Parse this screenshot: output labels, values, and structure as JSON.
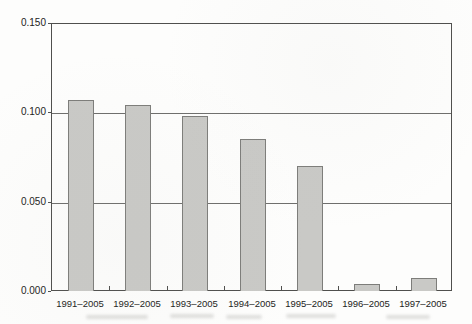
{
  "chart_data": {
    "type": "bar",
    "title": "",
    "categories": [
      "1991–2005",
      "1992–2005",
      "1993–2005",
      "1994–2005",
      "1995–2005",
      "1996–2005",
      "1997–2005"
    ],
    "values": [
      0.107,
      0.104,
      0.098,
      0.085,
      0.07,
      0.004,
      0.007
    ],
    "xlabel": "",
    "ylabel": "",
    "ylim": [
      0,
      0.15
    ],
    "ytick_labels": [
      "0.150",
      "0.100",
      "0.050",
      "0.000"
    ],
    "ytick_values": [
      0.15,
      0.1,
      0.05,
      0.0
    ],
    "gridline_values": [
      0.1,
      0.05
    ],
    "grid": "horizontal",
    "legend_position": "none",
    "colors": {
      "bar_fill": "#c9c9c6",
      "bar_border": "#7d7d7a",
      "axis_box": "#4f4f4d",
      "gridline": "#6e6e6c",
      "text": "#232321",
      "background": "#fdfdfc"
    }
  }
}
